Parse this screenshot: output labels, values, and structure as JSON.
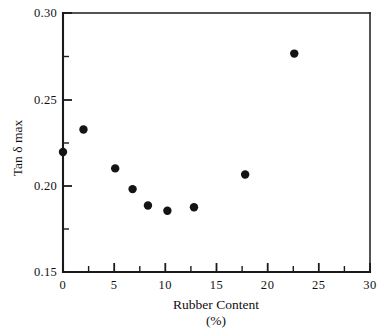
{
  "chart_data": {
    "type": "scatter",
    "title": "",
    "xlabel": "Rubber Content",
    "xlabel_units": "(%)",
    "ylabel": "Tan δ  max",
    "xlim": [
      0,
      30
    ],
    "ylim": [
      0.15,
      0.3
    ],
    "grid": false,
    "legend": null,
    "x_major_ticks": [
      0,
      5,
      10,
      15,
      20,
      25,
      30
    ],
    "x_major_tick_labels": [
      "0",
      "5",
      "10",
      "15",
      "20",
      "25",
      "30"
    ],
    "x_minor_ticks": [
      2.5,
      7.5,
      12.5,
      17.5,
      22.5,
      27.5
    ],
    "y_major_ticks": [
      0.15,
      0.2,
      0.25,
      0.3
    ],
    "y_major_tick_labels": [
      "0.15",
      "0.20",
      "0.25",
      "0.30"
    ],
    "y_minor_ticks": [
      0.175,
      0.225,
      0.275
    ],
    "series": [
      {
        "name": "Tan delta max",
        "marker": "filled-circle",
        "color": "#141414",
        "points": [
          {
            "x": 0.0,
            "y": 0.2195
          },
          {
            "x": 2.0,
            "y": 0.2325
          },
          {
            "x": 5.1,
            "y": 0.21
          },
          {
            "x": 6.8,
            "y": 0.198
          },
          {
            "x": 8.3,
            "y": 0.1885
          },
          {
            "x": 10.2,
            "y": 0.1855
          },
          {
            "x": 12.8,
            "y": 0.1875
          },
          {
            "x": 17.8,
            "y": 0.2065
          },
          {
            "x": 22.6,
            "y": 0.2765
          }
        ]
      }
    ]
  }
}
